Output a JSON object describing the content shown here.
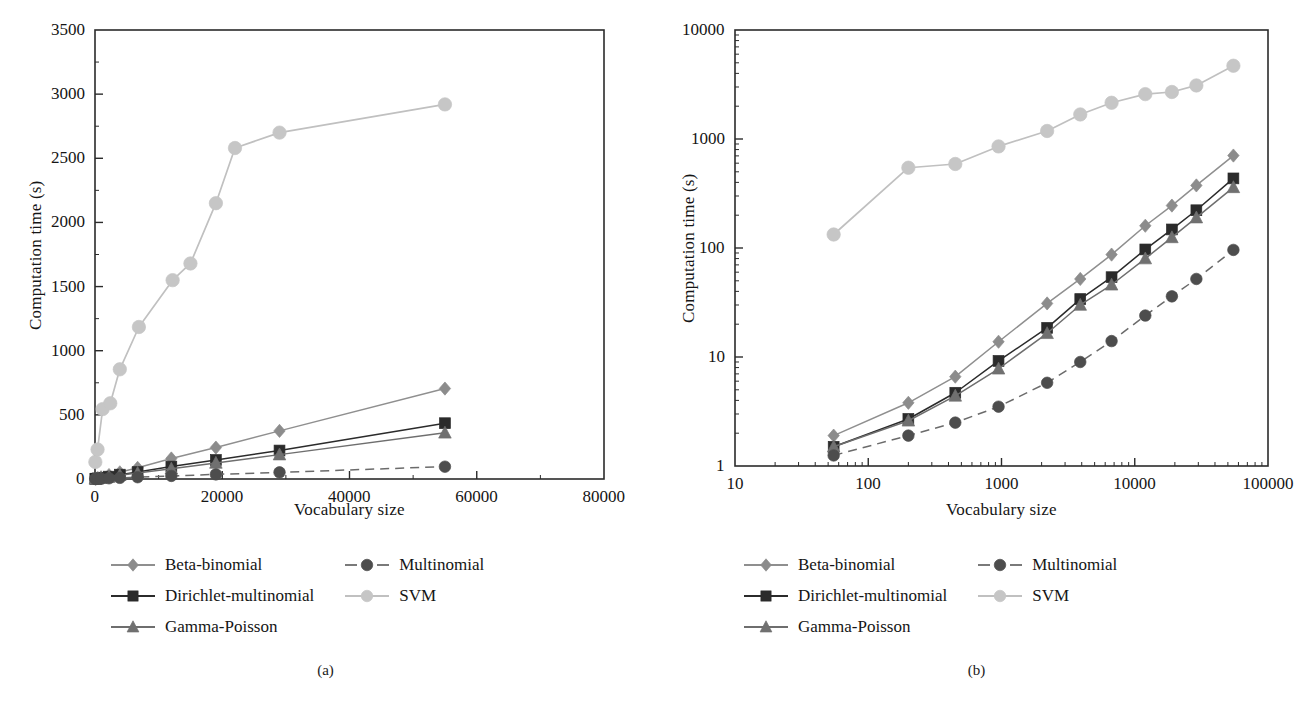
{
  "figure": {
    "panels": [
      {
        "id": "a",
        "caption": "(a)",
        "xlabel": "Vocabulary size",
        "ylabel": "Computation time (s)"
      },
      {
        "id": "b",
        "caption": "(b)",
        "xlabel": "Vocabulary size",
        "ylabel": "Computation time (s)"
      }
    ]
  },
  "legend": {
    "items": [
      {
        "label": "Beta-binomial",
        "marker": "diamond",
        "color": "#8c8c8c",
        "line": "solid",
        "line_color": "#8f8f8f"
      },
      {
        "label": "Multinomial",
        "marker": "circle",
        "color": "#4d4d4d",
        "line": "dashed",
        "line_color": "#6b6b6b"
      },
      {
        "label": "Dirichlet-multinomial",
        "marker": "square",
        "color": "#2b2b2b",
        "line": "solid",
        "line_color": "#2b2b2b"
      },
      {
        "label": "SVM",
        "marker": "circle",
        "color": "#c6c6c6",
        "line": "solid",
        "line_color": "#c0c0c0"
      },
      {
        "label": "Gamma-Poisson",
        "marker": "triangle",
        "color": "#707070",
        "line": "solid",
        "line_color": "#6e6e6e"
      }
    ],
    "order_left": [
      "Beta-binomial",
      "Dirichlet-multinomial",
      "Gamma-Poisson"
    ],
    "order_right": [
      "Multinomial",
      "SVM"
    ]
  },
  "chart_data": [
    {
      "type": "line",
      "panel": "a",
      "title": "",
      "xlabel": "Vocabulary size",
      "ylabel": "Computation time (s)",
      "xscale": "linear",
      "yscale": "linear",
      "xlim": [
        0,
        80000
      ],
      "ylim": [
        0,
        3500
      ],
      "xticks": [
        0,
        20000,
        40000,
        60000,
        80000
      ],
      "xticklabels": [
        "0",
        "20000",
        "40000",
        "60000",
        "80000"
      ],
      "yticks": [
        0,
        500,
        1000,
        1500,
        2000,
        2500,
        3000,
        3500
      ],
      "yticklabels": [
        "0",
        "500",
        "1000",
        "1500",
        "2000",
        "2500",
        "3000",
        "3500"
      ],
      "grid": false,
      "legend_position": "below",
      "x": [
        55,
        100,
        200,
        450,
        950,
        2200,
        3900,
        6700,
        12000,
        19000,
        29000,
        55000
      ],
      "series": [
        {
          "name": "Beta-binomial",
          "values": [
            1.9,
            2.6,
            3.8,
            6.6,
            13.8,
            31,
            52,
            87,
            160,
            245,
            375,
            705
          ]
        },
        {
          "name": "Dirichlet-multinomial",
          "values": [
            1.5,
            2.0,
            2.7,
            4.7,
            9.2,
            18.5,
            34,
            54,
            97,
            148,
            222,
            435
          ]
        },
        {
          "name": "Gamma-Poisson",
          "values": [
            1.5,
            1.9,
            2.6,
            4.4,
            7.8,
            16.5,
            30,
            46,
            80,
            125,
            190,
            360
          ]
        },
        {
          "name": "Multinomial",
          "values": [
            1.25,
            1.5,
            1.9,
            2.5,
            3.5,
            5.8,
            9.0,
            14.0,
            24,
            36,
            52,
            96
          ]
        },
        {
          "name": "SVM",
          "values": [
            133,
            230,
            545,
            590,
            855,
            1185,
            1550,
            1680,
            2150,
            2580,
            2700,
            2920
          ]
        }
      ],
      "series_x_override": {
        "SVM": [
          55,
          400,
          1200,
          2400,
          3900,
          6900,
          12200,
          15000,
          19000,
          22000,
          29000,
          55000
        ]
      }
    },
    {
      "type": "line",
      "panel": "b",
      "title": "",
      "xlabel": "Vocabulary size",
      "ylabel": "Computation time (s)",
      "xscale": "log",
      "yscale": "log",
      "xlim": [
        10,
        100000
      ],
      "ylim": [
        1,
        10000
      ],
      "xticks": [
        10,
        100,
        1000,
        10000,
        100000
      ],
      "xticklabels": [
        "10",
        "100",
        "1000",
        "10000",
        "100000"
      ],
      "yticks": [
        1,
        10,
        100,
        1000,
        10000
      ],
      "yticklabels": [
        "1",
        "10",
        "100",
        "1000",
        "10000"
      ],
      "grid": false,
      "legend_position": "below",
      "x": [
        55,
        200,
        450,
        950,
        2200,
        3900,
        6700,
        12000,
        19000,
        29000,
        55000
      ],
      "series": [
        {
          "name": "Beta-binomial",
          "values": [
            1.9,
            3.8,
            6.6,
            13.8,
            31,
            52,
            87,
            160,
            245,
            375,
            705
          ]
        },
        {
          "name": "Dirichlet-multinomial",
          "values": [
            1.5,
            2.7,
            4.7,
            9.2,
            18.5,
            34,
            54,
            97,
            148,
            222,
            435
          ]
        },
        {
          "name": "Gamma-Poisson",
          "values": [
            1.5,
            2.6,
            4.4,
            7.8,
            16.5,
            30,
            46,
            80,
            125,
            190,
            360
          ]
        },
        {
          "name": "Multinomial",
          "values": [
            1.25,
            1.9,
            2.5,
            3.5,
            5.8,
            9.0,
            14.0,
            24,
            36,
            52,
            96
          ]
        },
        {
          "name": "SVM",
          "values": [
            133,
            545,
            590,
            855,
            1185,
            1680,
            2150,
            2580,
            2700,
            3100,
            4700
          ]
        }
      ],
      "series_x_override": {
        "SVM": [
          55,
          200,
          450,
          950,
          2200,
          3900,
          6700,
          12000,
          19000,
          29000,
          55000
        ]
      }
    }
  ]
}
